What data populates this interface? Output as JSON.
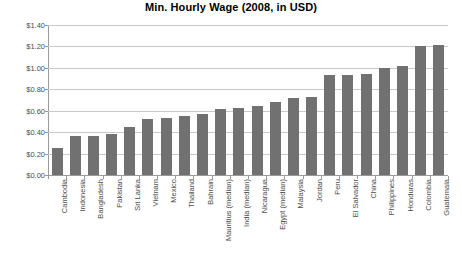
{
  "chart_data": {
    "type": "bar",
    "title": "Min. Hourly Wage (2008, in USD)",
    "xlabel": "",
    "ylabel": "",
    "ylim": [
      0,
      1.4
    ],
    "ytick_step": 0.2,
    "ytick_labels": [
      "$0.00",
      "$0.20",
      "$0.40",
      "$0.60",
      "$0.80",
      "$1.00",
      "$1.20",
      "$1.40"
    ],
    "ytick_values": [
      0,
      0.2,
      0.4,
      0.6,
      0.8,
      1.0,
      1.2,
      1.4
    ],
    "grid": true,
    "legend": "none",
    "bar_color": "#717171",
    "gridline_color": "#c9c9c9",
    "axis_color": "#9a9a9a",
    "categories": [
      "Cambodia",
      "Indonesia",
      "Bangladesh",
      "Pakistan",
      "Sri Lanka",
      "Vietnam",
      "Mexico",
      "Thailand",
      "Bahrain",
      "Mauritius (median)",
      "India (median)",
      "Nicaragua",
      "Egypt (median)",
      "Malaysia",
      "Jordan",
      "Peru",
      "El Salvador",
      "China",
      "Philippines",
      "Honduras",
      "Colombia",
      "Guatemala"
    ],
    "values": [
      0.25,
      0.36,
      0.36,
      0.38,
      0.45,
      0.52,
      0.53,
      0.55,
      0.57,
      0.62,
      0.63,
      0.64,
      0.68,
      0.72,
      0.73,
      0.93,
      0.93,
      0.94,
      1.0,
      1.02,
      1.2,
      1.21
    ]
  }
}
